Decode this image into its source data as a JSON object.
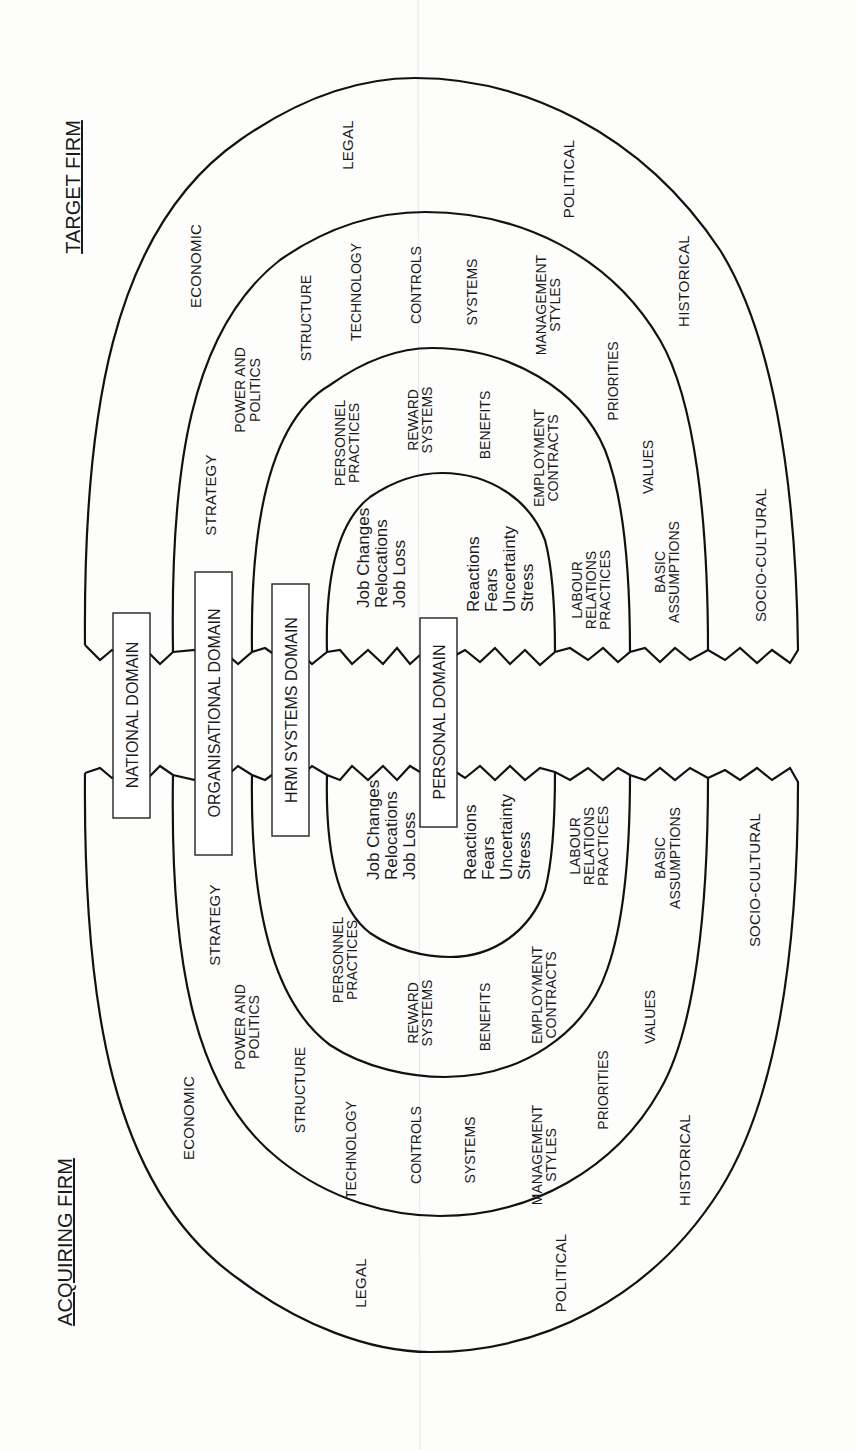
{
  "figure": {
    "orientation": "rotated-90-ccw",
    "firms": {
      "target": "TARGET FIRM",
      "acquiring": "ACQUIRING FIRM"
    },
    "domains": {
      "national": "NATIONAL DOMAIN",
      "organisational": "ORGANISATIONAL DOMAIN",
      "hrm": "HRM SYSTEMS DOMAIN",
      "personal": "PERSONAL DOMAIN"
    },
    "national_ring": {
      "economic": "ECONOMIC",
      "legal": "LEGAL",
      "political": "POLITICAL",
      "historical": "HISTORICAL",
      "socio_cultural": "SOCIO-CULTURAL"
    },
    "organisational_ring": {
      "strategy": "STRATEGY",
      "power_1": "POWER AND",
      "power_2": "POLITICS",
      "structure": "STRUCTURE",
      "technology": "TECHNOLOGY",
      "controls": "CONTROLS",
      "systems": "SYSTEMS",
      "mgmt_1": "MANAGEMENT",
      "mgmt_2": "STYLES",
      "priorities": "PRIORITIES",
      "values": "VALUES",
      "basic_1": "BASIC",
      "basic_2": "ASSUMPTIONS"
    },
    "hrm_ring": {
      "personnel_1": "PERSONNEL",
      "personnel_2": "PRACTICES",
      "reward_1": "REWARD",
      "reward_2": "SYSTEMS",
      "benefits": "BENEFITS",
      "employment_1": "EMPLOYMENT",
      "employment_2": "CONTRACTS",
      "labour_1": "LABOUR",
      "labour_2": "RELATIONS",
      "labour_3": "PRACTICES"
    },
    "personal_ring": {
      "job_changes": "Job Changes",
      "relocations": "Relocations",
      "job_loss": "Job Loss",
      "reactions": "Reactions",
      "fears": "Fears",
      "uncertainty": "Uncertainty",
      "stress": "Stress"
    }
  }
}
